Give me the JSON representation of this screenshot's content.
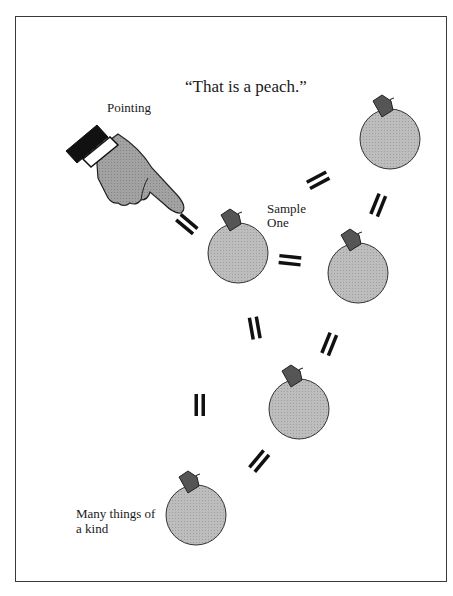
{
  "diagram": {
    "title": "“That is a peach.”",
    "labels": {
      "pointing": "Pointing",
      "sample_line1": "Sample",
      "sample_line2": "One",
      "many_line1": "Many things of",
      "many_line2": "a kind"
    },
    "colors": {
      "peach_fill": "#b8b8b8",
      "leaf_fill": "#5a5a5a",
      "hand_fill": "#9c9c9c",
      "cuff": "#111111",
      "outline": "#333333",
      "equals": "#111111",
      "frame": "#3a3a3a"
    },
    "nodes": [
      {
        "id": "peach-sample-one",
        "cx": 238,
        "cy": 253,
        "r": 30
      },
      {
        "id": "peach-top-right",
        "cx": 390,
        "cy": 139,
        "r": 30
      },
      {
        "id": "peach-right-middle",
        "cx": 358,
        "cy": 273,
        "r": 30
      },
      {
        "id": "peach-lower-middle",
        "cx": 299,
        "cy": 409,
        "r": 30
      },
      {
        "id": "peach-bottom",
        "cx": 196,
        "cy": 515,
        "r": 30
      }
    ],
    "connectors": [
      {
        "from": "hand",
        "to": "peach-sample-one",
        "symbol": "="
      },
      {
        "from": "peach-sample-one",
        "to": "peach-top-right",
        "symbol": "="
      },
      {
        "from": "peach-sample-one",
        "to": "peach-right-middle",
        "symbol": "="
      },
      {
        "from": "peach-top-right",
        "to": "peach-right-middle",
        "symbol": "="
      },
      {
        "from": "peach-sample-one",
        "to": "peach-lower-middle",
        "symbol": "="
      },
      {
        "from": "peach-right-middle",
        "to": "peach-lower-middle",
        "symbol": "="
      },
      {
        "from": "peach-sample-one",
        "to": "peach-bottom",
        "symbol": "="
      },
      {
        "from": "peach-lower-middle",
        "to": "peach-bottom",
        "symbol": "="
      }
    ]
  }
}
